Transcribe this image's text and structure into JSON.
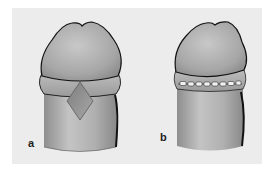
{
  "figure": {
    "background": "#ececec",
    "fill_color": "#a9a9a9",
    "outline_color": "#111111",
    "panels": [
      {
        "id": "a",
        "label": "a",
        "feature": "diamond-shaped-incision"
      },
      {
        "id": "b",
        "label": "b",
        "feature": "sutured-circumferential-closure"
      }
    ]
  }
}
